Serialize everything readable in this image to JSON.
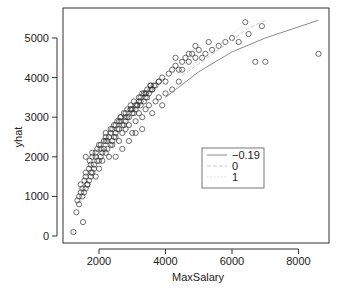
{
  "chart_data": {
    "type": "scatter",
    "title": "",
    "xlabel": "MaxSalary",
    "ylabel": "yhat",
    "xlim": [
      1000,
      8800
    ],
    "ylim": [
      -150,
      5500
    ],
    "xticks": [
      2000,
      4000,
      6000,
      8000
    ],
    "yticks": [
      0,
      1000,
      2000,
      3000,
      4000,
      5000
    ],
    "grid": false,
    "legend": {
      "position": "inside-lower-right",
      "entries": [
        {
          "label": "−0.19",
          "style": "solid",
          "color": "#8a8a8a"
        },
        {
          "label": "0",
          "style": "dashed",
          "color": "#c8c8c8"
        },
        {
          "label": "1",
          "style": "dotted",
          "color": "#d8d8d8"
        }
      ]
    },
    "series": [
      {
        "name": "observed",
        "kind": "points",
        "marker": "open-circle",
        "color": "#333333",
        "x": [
          1230,
          1320,
          1350,
          1400,
          1450,
          1500,
          1520,
          1560,
          1600,
          1650,
          1700,
          1720,
          1760,
          1800,
          1850,
          1900,
          1950,
          2000,
          2050,
          2100,
          2150,
          2200,
          2250,
          2300,
          2350,
          2400,
          2450,
          2500,
          2550,
          2600,
          2650,
          2700,
          2750,
          2800,
          2850,
          2900,
          2950,
          3000,
          3050,
          3100,
          3150,
          3200,
          3250,
          3300,
          3350,
          3400,
          3450,
          3500,
          3550,
          3600,
          3700,
          3800,
          3900,
          4000,
          4100,
          4200,
          4300,
          4400,
          4500,
          4600,
          4700,
          4800,
          4900,
          5000,
          5200,
          5400,
          5600,
          5800,
          6000,
          6200,
          6400,
          6500,
          6700,
          6900,
          7000,
          8600,
          1400,
          1500,
          1600,
          1700,
          1800,
          1900,
          2000,
          2100,
          2200,
          2300,
          2400,
          2500,
          2600,
          2700,
          2800,
          2900,
          3000,
          3100,
          3200,
          3300,
          3400,
          3500,
          3600,
          3700,
          3800,
          3900,
          4000,
          4200,
          4400,
          1550,
          1650,
          1750,
          1850,
          1950,
          2050,
          2150,
          2250,
          2350,
          2450,
          2550,
          2650,
          2750,
          2850,
          2950,
          3050,
          3150,
          3250,
          3350,
          3450,
          3550,
          3650,
          2500,
          2700,
          2900,
          3100,
          3300,
          1450,
          1600,
          1750,
          1900,
          2050,
          2200,
          2350,
          2500,
          2650,
          2800,
          2950,
          3100,
          3250,
          3400,
          3550,
          4300,
          4500,
          4700,
          4900,
          5100,
          5300,
          1600,
          1800,
          2000,
          2200,
          2400,
          2600,
          2800,
          3000,
          3200,
          3400,
          3600,
          3800
        ],
        "y": [
          100,
          600,
          900,
          1000,
          1100,
          1200,
          350,
          1400,
          1500,
          1300,
          1700,
          1900,
          1600,
          2000,
          1800,
          2100,
          2200,
          1900,
          2300,
          2100,
          2400,
          2600,
          2200,
          2500,
          2700,
          2400,
          2800,
          2600,
          2900,
          2700,
          3000,
          2800,
          3100,
          2900,
          3200,
          3000,
          3300,
          3100,
          3400,
          3200,
          3300,
          3500,
          3300,
          3600,
          3400,
          3500,
          3700,
          3600,
          3800,
          3700,
          3800,
          3900,
          4000,
          3900,
          4100,
          4200,
          4300,
          4200,
          4400,
          4500,
          4400,
          4600,
          4500,
          4700,
          4600,
          4700,
          4800,
          4900,
          5000,
          4900,
          5400,
          5100,
          4400,
          5300,
          4400,
          4600,
          800,
          1000,
          1200,
          1400,
          1600,
          1500,
          1700,
          1900,
          2100,
          2000,
          2300,
          2500,
          2400,
          2600,
          2700,
          2800,
          2600,
          2900,
          3100,
          3000,
          3200,
          3300,
          3100,
          3400,
          3500,
          3300,
          3600,
          3700,
          3900,
          1100,
          1300,
          1500,
          1700,
          1900,
          2000,
          2200,
          2400,
          2300,
          2500,
          2700,
          2900,
          2800,
          3000,
          3200,
          3100,
          3300,
          3400,
          3600,
          3500,
          3700,
          3800,
          2000,
          2200,
          2400,
          2600,
          2700,
          1300,
          1600,
          1800,
          2000,
          2200,
          2400,
          2600,
          2800,
          3000,
          3100,
          3200,
          3300,
          3500,
          3600,
          3800,
          4500,
          4200,
          4600,
          4800,
          4500,
          4900,
          2000,
          2100,
          2300,
          2500,
          2700,
          2900,
          3000,
          3200,
          3400,
          3600,
          3700,
          3900
        ]
      },
      {
        "name": "-0.19",
        "kind": "line",
        "style": "solid",
        "x": [
          4000,
          5000,
          6000,
          7000,
          8600
        ],
        "y": [
          3500,
          4150,
          4650,
          5000,
          5450
        ]
      },
      {
        "name": "0",
        "kind": "line",
        "style": "dashed",
        "x": [
          4500,
          5500,
          6500,
          7000
        ],
        "y": [
          4050,
          4650,
          5250,
          5450
        ]
      },
      {
        "name": "1",
        "kind": "line",
        "style": "dotted",
        "x": [
          4500,
          5500,
          6300
        ],
        "y": [
          4100,
          4750,
          5300
        ]
      }
    ]
  }
}
